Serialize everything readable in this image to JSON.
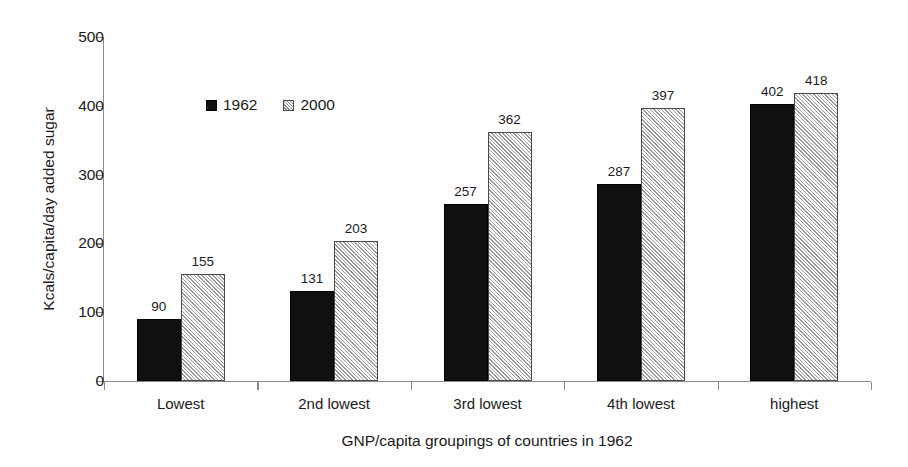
{
  "chart_data": {
    "type": "bar",
    "title": "",
    "subtitle": "",
    "xlabel": "GNP/capita groupings of countries in 1962",
    "ylabel": "Kcals/capita/day added sugar",
    "categories": [
      "Lowest",
      "2nd lowest",
      "3rd lowest",
      "4th lowest",
      "highest"
    ],
    "series": [
      {
        "name": "1962",
        "fill": "solid-black",
        "values": [
          90,
          131,
          257,
          287,
          402
        ]
      },
      {
        "name": "2000",
        "fill": "diagonal-hatch",
        "values": [
          155,
          203,
          362,
          397,
          418
        ]
      }
    ],
    "ylim": [
      0,
      500
    ],
    "yticks": [
      0,
      100,
      200,
      300,
      400,
      500
    ],
    "ytick_labels": [
      "0",
      "100",
      "200",
      "300",
      "400",
      "500"
    ],
    "grid": false,
    "data_labels": true,
    "legend_position": "inside-upper-left",
    "colors": {
      "series_1962": "#101010",
      "series_2000": "#e2e2e2",
      "hatch_stroke": "#9a9a9a",
      "axis": "#8a8a8a",
      "text": "#1a1a1a",
      "background": "#ffffff"
    }
  },
  "legend": {
    "items": [
      {
        "label": "1962",
        "swatch": "solid-swatch"
      },
      {
        "label": "2000",
        "swatch": "hatched-swatch"
      }
    ]
  }
}
